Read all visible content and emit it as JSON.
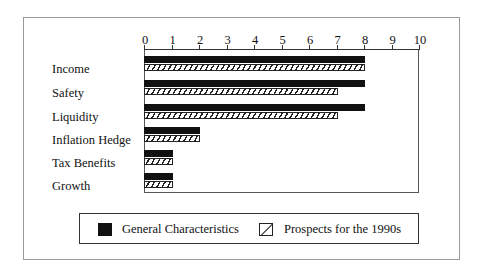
{
  "chart_data": {
    "type": "bar",
    "orientation": "horizontal",
    "title": "",
    "xlabel": "",
    "ylabel": "",
    "xlim": [
      0,
      10
    ],
    "x_ticks": [
      "0",
      "1",
      "2",
      "3",
      "4",
      "5",
      "6",
      "7",
      "8",
      "9",
      "10"
    ],
    "categories": [
      "Income",
      "Safety",
      "Liquidity",
      "Inflation Hedge",
      "Tax Benefits",
      "Growth"
    ],
    "series": [
      {
        "name": "General Characteristics",
        "style": "solid",
        "color": "#111111",
        "values": [
          8,
          8,
          8,
          2,
          1,
          1
        ]
      },
      {
        "name": "Prospects for the 1990s",
        "style": "hatched",
        "color": "#222222",
        "values": [
          8,
          7,
          7,
          2,
          1,
          1
        ]
      }
    ],
    "legend_position": "bottom",
    "grid": false
  },
  "legend": {
    "items": [
      {
        "label": "General Characteristics"
      },
      {
        "label": "Prospects for the 1990s"
      }
    ]
  }
}
